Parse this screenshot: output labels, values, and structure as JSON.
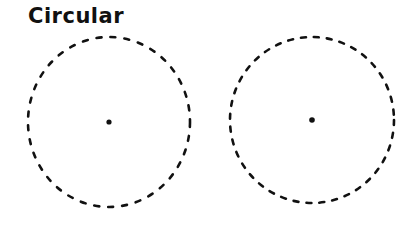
{
  "title": "Circular",
  "colors": {
    "stroke": "#111111",
    "background": "#ffffff"
  },
  "circles": [
    {
      "name": "left-circle",
      "cx": 109,
      "cy": 122,
      "rx": 81,
      "ry": 85,
      "center_dot": true
    },
    {
      "name": "right-circle",
      "cx": 312,
      "cy": 120,
      "rx": 82,
      "ry": 83,
      "center_dot": true
    }
  ]
}
